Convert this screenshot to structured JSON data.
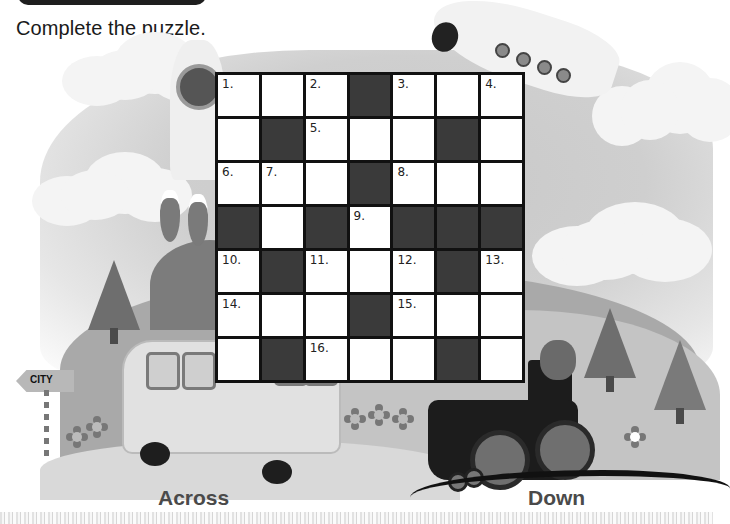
{
  "header": {
    "instruction": "Complete the puzzle."
  },
  "crossword": {
    "rows": 7,
    "cols": 7,
    "cells": [
      [
        {
          "type": "white",
          "number": "1."
        },
        {
          "type": "white",
          "number": ""
        },
        {
          "type": "white",
          "number": "2."
        },
        {
          "type": "black",
          "number": ""
        },
        {
          "type": "white",
          "number": "3."
        },
        {
          "type": "white",
          "number": ""
        },
        {
          "type": "white",
          "number": "4."
        }
      ],
      [
        {
          "type": "white",
          "number": ""
        },
        {
          "type": "black",
          "number": ""
        },
        {
          "type": "white",
          "number": "5."
        },
        {
          "type": "white",
          "number": ""
        },
        {
          "type": "white",
          "number": ""
        },
        {
          "type": "black",
          "number": ""
        },
        {
          "type": "white",
          "number": ""
        }
      ],
      [
        {
          "type": "white",
          "number": "6."
        },
        {
          "type": "white",
          "number": "7."
        },
        {
          "type": "white",
          "number": ""
        },
        {
          "type": "black",
          "number": ""
        },
        {
          "type": "white",
          "number": "8."
        },
        {
          "type": "white",
          "number": ""
        },
        {
          "type": "white",
          "number": ""
        }
      ],
      [
        {
          "type": "black",
          "number": ""
        },
        {
          "type": "white",
          "number": ""
        },
        {
          "type": "black",
          "number": ""
        },
        {
          "type": "white",
          "number": "9."
        },
        {
          "type": "black",
          "number": ""
        },
        {
          "type": "black",
          "number": ""
        },
        {
          "type": "black",
          "number": ""
        }
      ],
      [
        {
          "type": "white",
          "number": "10."
        },
        {
          "type": "black",
          "number": ""
        },
        {
          "type": "white",
          "number": "11."
        },
        {
          "type": "white",
          "number": ""
        },
        {
          "type": "white",
          "number": "12."
        },
        {
          "type": "black",
          "number": ""
        },
        {
          "type": "white",
          "number": "13."
        }
      ],
      [
        {
          "type": "white",
          "number": "14."
        },
        {
          "type": "white",
          "number": ""
        },
        {
          "type": "white",
          "number": ""
        },
        {
          "type": "black",
          "number": ""
        },
        {
          "type": "white",
          "number": "15."
        },
        {
          "type": "white",
          "number": ""
        },
        {
          "type": "white",
          "number": ""
        }
      ],
      [
        {
          "type": "white",
          "number": ""
        },
        {
          "type": "black",
          "number": ""
        },
        {
          "type": "white",
          "number": "16."
        },
        {
          "type": "white",
          "number": ""
        },
        {
          "type": "white",
          "number": ""
        },
        {
          "type": "black",
          "number": ""
        },
        {
          "type": "white",
          "number": ""
        }
      ]
    ]
  },
  "illustration": {
    "sign_text": "CITY",
    "elements": [
      "rocket-icon",
      "airplane-icon",
      "school-bus-icon",
      "steam-train-icon",
      "pine-tree-icon",
      "flower-icon",
      "cloud-icon",
      "direction-sign-icon"
    ]
  },
  "clues": {
    "across_label": "Across",
    "down_label": "Down"
  },
  "colors": {
    "grid_line": "#111111",
    "black_cell": "#3a3a3a",
    "white_cell": "#ffffff",
    "label_text": "#4a4a4a"
  }
}
